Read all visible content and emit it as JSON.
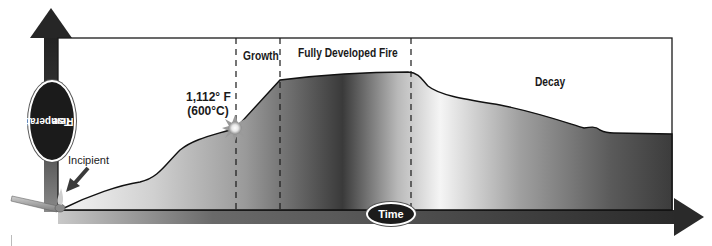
{
  "diagram": {
    "axes": {
      "y_label_line1": "Temperature",
      "y_label_line2": "Rise",
      "x_label": "Time"
    },
    "phases": [
      {
        "label": "Incipient"
      },
      {
        "label": "Growth"
      },
      {
        "label": "Fully Developed Fire"
      },
      {
        "label": "Decay"
      }
    ],
    "annotation": {
      "temp_f": "1,112° F",
      "temp_c": "(600°C)",
      "icon": "flashover-burst-icon"
    },
    "colors": {
      "axis_arrow": "#2a2a2a",
      "curve_fill_dark": "#3a3a3a",
      "curve_fill_light": "#f2f2f2",
      "frame": "#1a1a1a",
      "label_oval": "#1b1b1b"
    }
  }
}
